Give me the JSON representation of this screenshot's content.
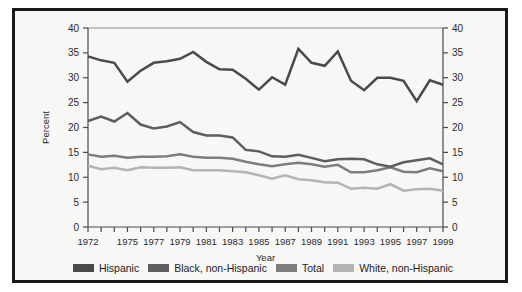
{
  "figure": {
    "background": "#f7f7f6",
    "border_color": "#1a1a1a"
  },
  "axis": {
    "ylabel": "Percent",
    "xlabel": "Year",
    "yticks": [
      "0",
      "5",
      "10",
      "15",
      "20",
      "25",
      "30",
      "35",
      "40"
    ],
    "xtick_labels": [
      "1972",
      "1975",
      "1977",
      "1979",
      "1981",
      "1983",
      "1985",
      "1987",
      "1989",
      "1991",
      "1993",
      "1995",
      "1997",
      "1999"
    ]
  },
  "legend": {
    "items": [
      {
        "label": "Hispanic",
        "color": "#4a4a4a"
      },
      {
        "label": "Black, non-Hispanic",
        "color": "#5e5e5e"
      },
      {
        "label": "Total",
        "color": "#7d7d7d"
      },
      {
        "label": "White, non-Hispanic",
        "color": "#b4b4b4"
      }
    ]
  },
  "chart_data": {
    "type": "line",
    "title": "",
    "xlabel": "Year",
    "ylabel": "Percent",
    "xlim": [
      1972,
      1999
    ],
    "ylim": [
      0,
      40
    ],
    "yticks": [
      0,
      5,
      10,
      15,
      20,
      25,
      30,
      35,
      40
    ],
    "xticks": [
      1972,
      1975,
      1977,
      1979,
      1981,
      1983,
      1985,
      1987,
      1989,
      1991,
      1993,
      1995,
      1997,
      1999
    ],
    "grid": false,
    "legend_position": "bottom",
    "x": [
      1972,
      1973,
      1974,
      1975,
      1976,
      1977,
      1978,
      1979,
      1980,
      1981,
      1982,
      1983,
      1984,
      1985,
      1986,
      1987,
      1988,
      1989,
      1990,
      1991,
      1992,
      1993,
      1994,
      1995,
      1996,
      1997,
      1998,
      1999
    ],
    "series": [
      {
        "name": "Hispanic",
        "color": "#4a4a4a",
        "values": [
          34.3,
          33.5,
          33.0,
          29.2,
          31.4,
          33.0,
          33.3,
          33.8,
          35.2,
          33.2,
          31.7,
          31.6,
          29.8,
          27.6,
          30.1,
          28.6,
          35.8,
          33.0,
          32.4,
          35.3,
          29.4,
          27.5,
          30.0,
          30.0,
          29.4,
          25.3,
          29.5,
          28.6
        ]
      },
      {
        "name": "Black, non-Hispanic",
        "color": "#5e5e5e",
        "values": [
          21.3,
          22.2,
          21.2,
          22.9,
          20.6,
          19.8,
          20.2,
          21.1,
          19.1,
          18.4,
          18.4,
          18.0,
          15.5,
          15.2,
          14.2,
          14.1,
          14.5,
          13.9,
          13.2,
          13.6,
          13.7,
          13.6,
          12.6,
          12.1,
          13.0,
          13.4,
          13.8,
          12.6
        ]
      },
      {
        "name": "Total",
        "color": "#7d7d7d",
        "values": [
          14.6,
          14.1,
          14.3,
          13.9,
          14.1,
          14.1,
          14.2,
          14.6,
          14.1,
          13.9,
          13.9,
          13.7,
          13.1,
          12.6,
          12.2,
          12.6,
          12.9,
          12.6,
          12.1,
          12.5,
          11.0,
          11.0,
          11.4,
          12.0,
          11.1,
          11.0,
          11.8,
          11.2
        ]
      },
      {
        "name": "White, non-Hispanic",
        "color": "#b4b4b4",
        "values": [
          12.3,
          11.6,
          11.9,
          11.4,
          12.0,
          11.9,
          11.9,
          12.0,
          11.4,
          11.4,
          11.4,
          11.2,
          11.0,
          10.4,
          9.7,
          10.4,
          9.6,
          9.4,
          9.0,
          8.9,
          7.7,
          7.9,
          7.7,
          8.6,
          7.3,
          7.6,
          7.7,
          7.3
        ]
      }
    ]
  }
}
